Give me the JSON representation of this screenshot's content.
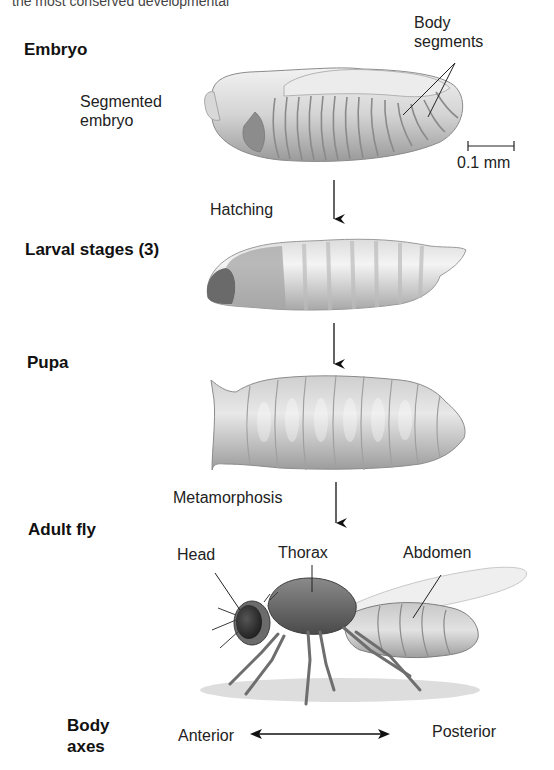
{
  "header_fragment": "the most conserved developmental",
  "stages": {
    "embryo": "Embryo",
    "larval": "Larval stages (3)",
    "pupa": "Pupa",
    "adult": "Adult fly",
    "axes_line1": "Body",
    "axes_line2": "axes"
  },
  "embryo_labels": {
    "segmented_line1": "Segmented",
    "segmented_line2": "embryo",
    "body_seg_line1": "Body",
    "body_seg_line2": "segments",
    "scale_bar": "0.1 mm"
  },
  "transitions": {
    "hatching": "Hatching",
    "metamorphosis": "Metamorphosis"
  },
  "adult_labels": {
    "head": "Head",
    "thorax": "Thorax",
    "abdomen": "Abdomen"
  },
  "axes": {
    "anterior": "Anterior",
    "posterior": "Posterior"
  },
  "colors": {
    "text": "#1a1a1a",
    "body_light": "#e6e6e6",
    "body_mid": "#bdbdbd",
    "body_dark": "#6e6e6e"
  }
}
